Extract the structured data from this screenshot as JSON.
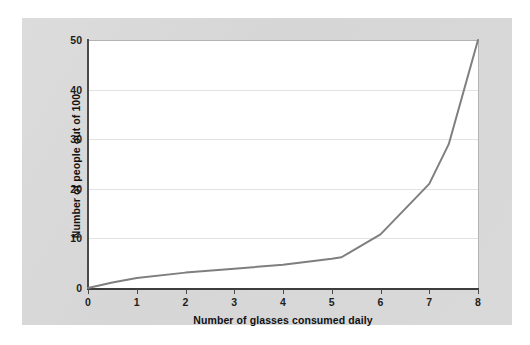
{
  "page": {
    "background_color": "#ffffff",
    "panel_color": "#d8d8d8"
  },
  "chart_data": {
    "type": "line",
    "title": "",
    "subtitle": "",
    "xlabel": "Number of glasses consumed daily",
    "ylabel": "Number of people out of 100",
    "xlim": [
      0,
      8
    ],
    "ylim": [
      0,
      50
    ],
    "xticks": [
      0,
      1,
      2,
      3,
      4,
      5,
      6,
      7,
      8
    ],
    "xtick_labels": [
      "0",
      "1",
      "2",
      "3",
      "4",
      "5",
      "6",
      "7",
      "8"
    ],
    "yticks": [
      0,
      10,
      20,
      30,
      40,
      50
    ],
    "ytick_labels": [
      "0",
      "10",
      "20",
      "30",
      "40",
      "50"
    ],
    "gridlines_y": [
      10,
      20,
      30,
      40
    ],
    "grid": true,
    "grid_color": "#e2e2e2",
    "legend": null,
    "legend_position": "none",
    "line_color": "#7f7f7f",
    "line_width": 2.0,
    "series": [
      {
        "name": "people",
        "x": [
          0,
          0.5,
          1,
          2,
          3,
          4,
          5,
          5.2,
          6,
          7,
          7.4,
          8
        ],
        "values": [
          0,
          1.1,
          2.0,
          3.1,
          3.9,
          4.7,
          5.9,
          6.2,
          10.8,
          21.0,
          29.0,
          50.0
        ]
      }
    ],
    "annotations": []
  },
  "axes": {
    "y_title": "Number of people out of 100",
    "x_title": "Number of glasses consumed daily"
  }
}
